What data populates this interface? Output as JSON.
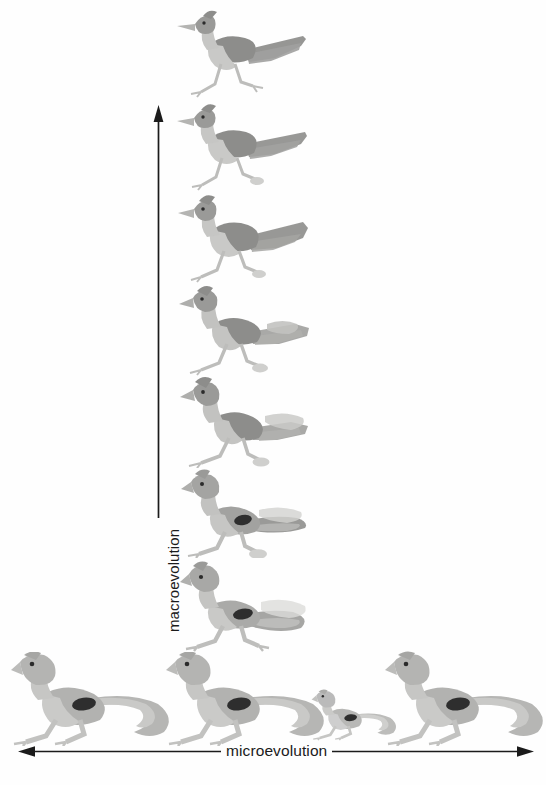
{
  "figure": {
    "title_visible": false,
    "background_color": "#fefefe",
    "ink_color": "#1b1b1b"
  },
  "axes": {
    "vertical": {
      "label": "macroevolution",
      "direction": "up",
      "arrowhead": "top",
      "line_color": "#1b1b1b",
      "x": 158,
      "y_top": 108,
      "y_bottom": 513
    },
    "horizontal": {
      "label": "microevolution",
      "direction": "both",
      "arrowhead": "both-ends",
      "line_color": "#1b1b1b",
      "y": 751,
      "x_left": 22,
      "x_right": 530
    }
  },
  "series": {
    "macro_column": {
      "description": "vertical series of transitional forms from lizard at bottom to roadrunner bird at top",
      "count": 7,
      "items": [
        {
          "name": "roadrunner-bird",
          "stage": 7,
          "form": "bird",
          "x": 175,
          "y": 8,
          "w": 135,
          "h": 92
        },
        {
          "name": "bird-like-form-6",
          "stage": 6,
          "form": "bird",
          "x": 175,
          "y": 100,
          "w": 135,
          "h": 92
        },
        {
          "name": "bird-like-form-5",
          "stage": 5,
          "form": "bird",
          "x": 175,
          "y": 192,
          "w": 135,
          "h": 92
        },
        {
          "name": "transitional-form-4",
          "stage": 4,
          "form": "transitional",
          "x": 175,
          "y": 284,
          "w": 135,
          "h": 92
        },
        {
          "name": "transitional-form-3",
          "stage": 3,
          "form": "transitional",
          "x": 175,
          "y": 376,
          "w": 135,
          "h": 92
        },
        {
          "name": "lizard-like-form-2",
          "stage": 2,
          "form": "reptile",
          "x": 175,
          "y": 466,
          "w": 135,
          "h": 92
        },
        {
          "name": "lizard-form-1",
          "stage": 1,
          "form": "reptile",
          "x": 175,
          "y": 556,
          "w": 140,
          "h": 96
        }
      ]
    },
    "micro_row": {
      "description": "horizontal row of four lizards of varying size showing within-species variation",
      "count": 4,
      "items": [
        {
          "name": "lizard-variant-1",
          "size": "large",
          "x": 8,
          "y": 652,
          "w": 172,
          "h": 94
        },
        {
          "name": "lizard-variant-2",
          "size": "large",
          "x": 163,
          "y": 652,
          "w": 172,
          "h": 94
        },
        {
          "name": "lizard-variant-3",
          "size": "small",
          "x": 310,
          "y": 684,
          "w": 92,
          "h": 62
        },
        {
          "name": "lizard-variant-4",
          "size": "large",
          "x": 382,
          "y": 650,
          "w": 172,
          "h": 96
        }
      ]
    }
  },
  "colors": {
    "body_light": "#c9c9c7",
    "body_mid": "#a8a8a6",
    "body_dark": "#8d8d8b",
    "wing_dark": "#7d7d7c",
    "eye": "#2b2b2b",
    "paper": "#fefefe"
  }
}
